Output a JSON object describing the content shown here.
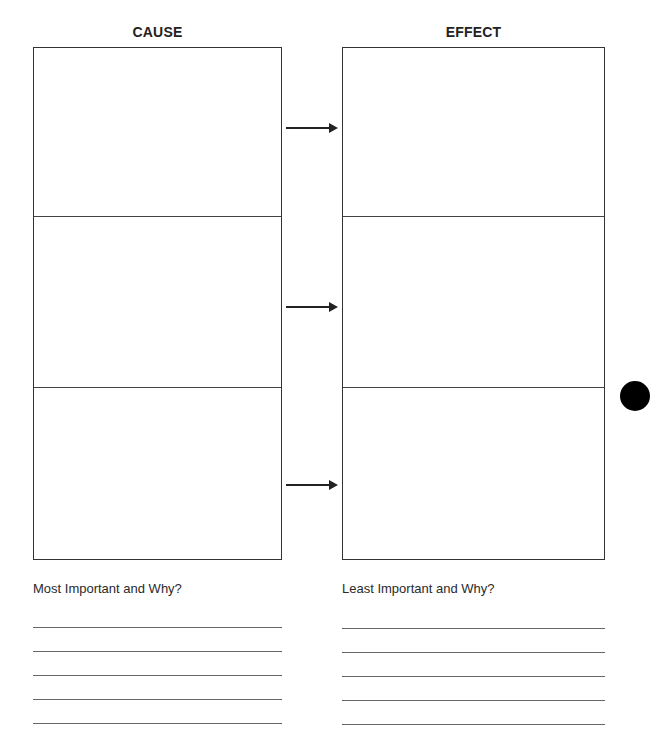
{
  "organizer": {
    "cause_column": {
      "title": "CAUSE",
      "boxes": [
        {
          "label": "cause-box-1",
          "text": ""
        },
        {
          "label": "cause-box-2",
          "text": ""
        },
        {
          "label": "cause-box-3",
          "text": ""
        }
      ]
    },
    "effect_column": {
      "title": "EFFECT",
      "boxes": [
        {
          "label": "effect-box-1",
          "text": ""
        },
        {
          "label": "effect-box-2",
          "text": ""
        },
        {
          "label": "effect-box-3",
          "text": ""
        }
      ]
    },
    "arrows": [
      {
        "icon": "arrow-right-icon",
        "from": "cause-box-1",
        "to": "effect-box-1"
      },
      {
        "icon": "arrow-right-icon",
        "from": "cause-box-2",
        "to": "effect-box-2"
      },
      {
        "icon": "arrow-right-icon",
        "from": "cause-box-3",
        "to": "effect-box-3"
      }
    ]
  },
  "reflection": {
    "most_important": {
      "prompt": "Most Important and Why?",
      "lines": [
        "",
        "",
        "",
        "",
        ""
      ]
    },
    "least_important": {
      "prompt": "Least Important and Why?",
      "lines": [
        "",
        "",
        "",
        "",
        ""
      ]
    }
  },
  "decorations": {
    "binder_hole_icon": "filled-circle"
  }
}
